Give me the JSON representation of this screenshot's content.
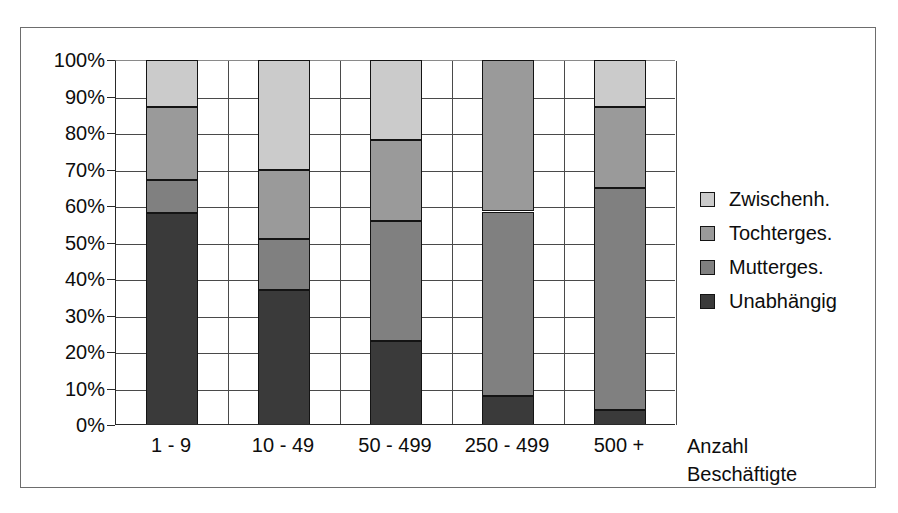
{
  "chart_data": {
    "type": "bar",
    "stacked": true,
    "normalized": "100%",
    "title": "",
    "subtitle": "",
    "xlabel": "Anzahl Beschäftigte",
    "ylabel": "",
    "categories": [
      "1 - 9",
      "10 - 49",
      "50 - 499",
      "250 - 499",
      "500 +"
    ],
    "series": [
      {
        "name": "Unabhängig",
        "values": [
          58,
          37,
          23,
          8,
          4
        ],
        "color": "#3a3a3a"
      },
      {
        "name": "Mutterges.",
        "values": [
          9,
          14,
          33,
          50.5,
          61
        ],
        "color": "#808080"
      },
      {
        "name": "Tochterges.",
        "values": [
          20,
          19,
          22,
          41.5,
          22
        ],
        "color": "#9a9a9a"
      },
      {
        "name": "Zwischenh.",
        "values": [
          13,
          30,
          22,
          0,
          13
        ],
        "color": "#cbcbcb"
      }
    ],
    "cumulative_tops": {
      "1 - 9": {
        "Unabhängig": 58,
        "Mutterges.": 67,
        "Tochterges.": 87,
        "Zwischenh.": 100
      },
      "10 - 49": {
        "Unabhängig": 37,
        "Mutterges.": 51,
        "Tochterges.": 70,
        "Zwischenh.": 100
      },
      "50 - 499": {
        "Unabhängig": 23,
        "Mutterges.": 56,
        "Tochterges.": 78,
        "Zwischenh.": 100
      },
      "250 - 499": {
        "Unabhängig": 8,
        "Mutterges.": 58.5,
        "Tochterges.": 100,
        "Zwischenh.": 100
      },
      "500 +": {
        "Unabhängig": 4,
        "Mutterges.": 65,
        "Tochterges.": 87,
        "Zwischenh.": 100
      }
    },
    "ylim": [
      0,
      100
    ],
    "ytick_labels": [
      "0%",
      "10%",
      "20%",
      "30%",
      "40%",
      "50%",
      "60%",
      "70%",
      "80%",
      "90%",
      "100%"
    ],
    "ytick_values": [
      0,
      10,
      20,
      30,
      40,
      50,
      60,
      70,
      80,
      90,
      100
    ],
    "grid": true,
    "grid_axis": "both",
    "legend_position": "right",
    "legend_order": [
      "Zwischenh.",
      "Tochterges.",
      "Mutterges.",
      "Unabhängig"
    ]
  },
  "axis_title": {
    "line1": "Anzahl",
    "line2": "Beschäftigte"
  },
  "legend": {
    "items": [
      {
        "label": "Zwischenh.",
        "color": "#cbcbcb"
      },
      {
        "label": "Tochterges.",
        "color": "#9a9a9a"
      },
      {
        "label": "Mutterges.",
        "color": "#808080"
      },
      {
        "label": "Unabhängig",
        "color": "#3a3a3a"
      }
    ]
  }
}
